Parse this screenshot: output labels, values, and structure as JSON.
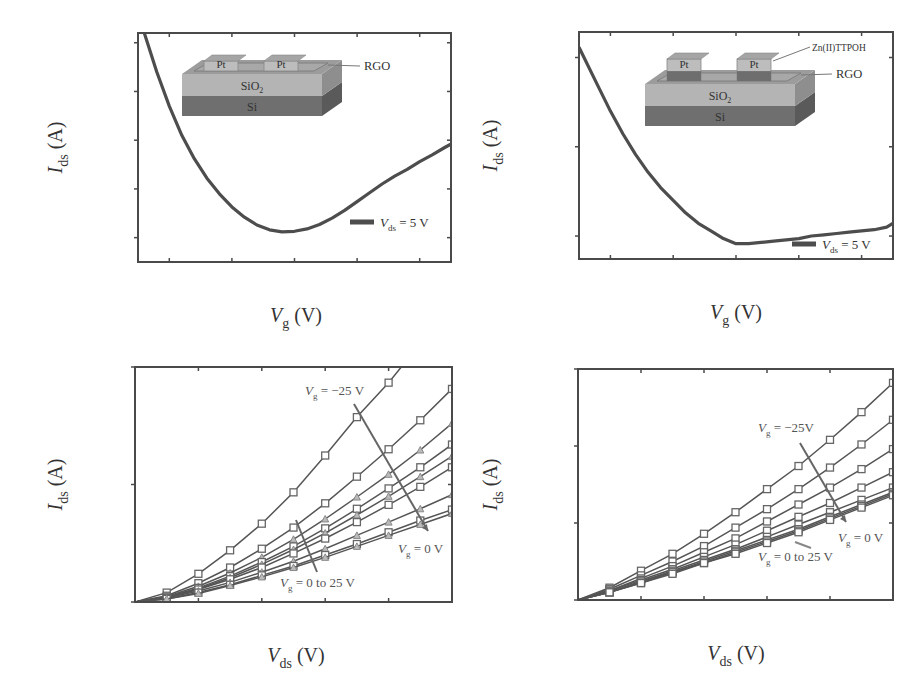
{
  "figure": {
    "panels": [
      "(a)",
      "(b)",
      "(c)",
      "(d)"
    ]
  },
  "chart_data": [
    {
      "id": "a",
      "panel_label": "(a)",
      "type": "line",
      "title": "",
      "xlabel": "V_g (V)",
      "ylabel": "I_ds (A)",
      "xlim": [
        -25,
        25
      ],
      "ylim": [
        50,
        520
      ],
      "y_unit": "nA",
      "xticks": [
        -20,
        0,
        20
      ],
      "xtick_labels": [
        "−20",
        "0",
        "20"
      ],
      "yticks": [
        200,
        400
      ],
      "ytick_labels": [
        "200.0n",
        "400.0n"
      ],
      "legend": "V_ds = 5 V",
      "legend_position": "lower right",
      "inset": {
        "layers": [
          "Pt",
          "Pt",
          "RGO",
          "SiO2",
          "Si"
        ],
        "callout": "RGO"
      },
      "series": [
        {
          "name": "V_ds = 5 V",
          "x": [
            -24,
            -22,
            -20,
            -18,
            -16,
            -14,
            -12,
            -10,
            -8,
            -6,
            -4,
            -2,
            0,
            2,
            4,
            6,
            8,
            10,
            12,
            14,
            16,
            18,
            20,
            22,
            24,
            25
          ],
          "y": [
            520,
            440,
            370,
            310,
            262,
            222,
            190,
            163,
            142,
            126,
            116,
            112,
            113,
            118,
            127,
            140,
            156,
            174,
            192,
            210,
            226,
            240,
            256,
            270,
            285,
            292
          ]
        }
      ]
    },
    {
      "id": "b",
      "panel_label": "(b)",
      "type": "line",
      "title": "",
      "xlabel": "V_ds (V)",
      "ylabel": "I_ds (A)",
      "xlim": [
        0,
        5
      ],
      "ylim": [
        0,
        300
      ],
      "y_unit": "nA",
      "xticks": [
        0,
        2,
        4
      ],
      "xtick_labels": [
        "0",
        "2",
        "4"
      ],
      "yticks": [
        0,
        300
      ],
      "ytick_labels": [
        "0.0",
        "300.0n"
      ],
      "annotations": [
        "V_g = −25 V",
        "V_g = 0 V",
        "V_g = 0 to 25 V"
      ],
      "x": [
        0,
        0.5,
        1.0,
        1.5,
        2.0,
        2.5,
        3.0,
        3.5,
        4.0,
        4.5,
        5.0
      ],
      "series": [
        {
          "name": "V_g = -25 V",
          "values": [
            0,
            12,
            36,
            66,
            100,
            140,
            187,
            236,
            280,
            330,
            380
          ]
        },
        {
          "name": "V_g = -20 V",
          "values": [
            0,
            8,
            24,
            44,
            68,
            95,
            126,
            160,
            195,
            232,
            272
          ]
        },
        {
          "name": "V_g = -15 V",
          "values": [
            0,
            7,
            20,
            37,
            57,
            80,
            106,
            134,
            163,
            194,
            228
          ]
        },
        {
          "name": "V_g = -10 V",
          "values": [
            0,
            6,
            18,
            33,
            51,
            71,
            94,
            119,
            145,
            172,
            201
          ]
        },
        {
          "name": "V_g = -5 V",
          "values": [
            0,
            6,
            17,
            31,
            48,
            67,
            88,
            111,
            135,
            160,
            186
          ]
        },
        {
          "name": "V_g = 0 V",
          "values": [
            0,
            5,
            16,
            29,
            44,
            62,
            81,
            102,
            124,
            147,
            172
          ]
        },
        {
          "name": "V_g = 5 V",
          "values": [
            0,
            5,
            14,
            25,
            38,
            52,
            68,
            85,
            102,
            119,
            137
          ]
        },
        {
          "name": "V_g = 15 V",
          "values": [
            0,
            4,
            12,
            22,
            34,
            46,
            60,
            74,
            89,
            104,
            118
          ]
        },
        {
          "name": "V_g = 25 V",
          "values": [
            0,
            4,
            11,
            21,
            32,
            44,
            57,
            71,
            85,
            99,
            113
          ]
        }
      ]
    },
    {
      "id": "c",
      "panel_label": "(c)",
      "type": "line",
      "title": "",
      "xlabel": "V_g (V)",
      "ylabel": "I_ds (A)",
      "xlim": [
        -25,
        25
      ],
      "ylim": [
        61,
        150
      ],
      "y_unit": "nA",
      "xticks": [
        -20,
        0,
        20
      ],
      "xtick_labels": [
        "−20",
        "0",
        "20"
      ],
      "yticks": [
        70,
        140
      ],
      "ytick_labels": [
        "70.0n",
        "140.0n"
      ],
      "legend": "V_ds = 5 V",
      "legend_position": "lower right",
      "inset": {
        "layers": [
          "Zn(II)TTPOH",
          "Pt",
          "Pt",
          "RGO",
          "SiO2",
          "Si"
        ],
        "callouts": [
          "Zn(II)TTPOH",
          "RGO"
        ]
      },
      "series": [
        {
          "name": "V_ds = 5 V",
          "x": [
            -25,
            -22,
            -20,
            -18,
            -16,
            -14,
            -12,
            -10,
            -8,
            -6,
            -4,
            -2,
            0,
            2,
            4,
            6,
            8,
            10,
            12,
            14,
            16,
            18,
            20,
            22,
            24,
            25
          ],
          "y": [
            144,
            129,
            119,
            110,
            102,
            95,
            89,
            84,
            79,
            75,
            72,
            69,
            67,
            67,
            67.5,
            68,
            68.5,
            69,
            70,
            70.5,
            71,
            71.5,
            72,
            72.5,
            73.5,
            75
          ]
        }
      ]
    },
    {
      "id": "d",
      "panel_label": "(d)",
      "type": "line",
      "title": "",
      "xlabel": "V_ds (V)",
      "ylabel": "I_ds (A)",
      "xlim": [
        0,
        5
      ],
      "ylim": [
        0,
        150
      ],
      "y_unit": "nA",
      "xticks": [
        0,
        2,
        4
      ],
      "xtick_labels": [
        "0",
        "2",
        "4"
      ],
      "yticks": [
        0,
        100
      ],
      "ytick_labels": [
        "0.0",
        "100.0n"
      ],
      "annotations": [
        "V_g = −25V",
        "V_g = 0 V",
        "V_g = 0 to 25 V"
      ],
      "x": [
        0,
        0.5,
        1.0,
        1.5,
        2.0,
        2.5,
        3.0,
        3.5,
        4.0,
        4.5,
        5.0
      ],
      "series": [
        {
          "name": "V_g = -25 V",
          "values": [
            0,
            8,
            19,
            30,
            43,
            57,
            72,
            87,
            104,
            122,
            141
          ]
        },
        {
          "name": "V_g = -20 V",
          "values": [
            0,
            7,
            16,
            25,
            35,
            47,
            59,
            72,
            86,
            101,
            117
          ]
        },
        {
          "name": "V_g = -15 V",
          "values": [
            0,
            6,
            14,
            22,
            31,
            40,
            51,
            62,
            73,
            85,
            98
          ]
        },
        {
          "name": "V_g = -10 V",
          "values": [
            0,
            6,
            13,
            20,
            28,
            36,
            45,
            54,
            63,
            73,
            83
          ]
        },
        {
          "name": "V_g = -5 V",
          "values": [
            0,
            5,
            12,
            19,
            26,
            33,
            41,
            49,
            57,
            65,
            73
          ]
        },
        {
          "name": "V_g = 0 V",
          "values": [
            0,
            5,
            12,
            18,
            25,
            32,
            39,
            46,
            54,
            62,
            70
          ]
        },
        {
          "name": "V_g = 10 V",
          "values": [
            0,
            5,
            11,
            18,
            24,
            31,
            38,
            45,
            53,
            61,
            69
          ]
        },
        {
          "name": "V_g = 25 V",
          "values": [
            0,
            5,
            11,
            17,
            24,
            30,
            37,
            44,
            52,
            60,
            68
          ]
        }
      ]
    }
  ]
}
